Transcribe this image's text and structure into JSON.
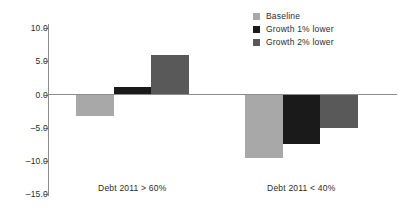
{
  "chart_data": {
    "type": "bar",
    "title": "",
    "subtitle": "",
    "xlabel": "",
    "ylabel": "",
    "categories": [
      "Debt 2011 > 60%",
      "Debt 2011 < 40%"
    ],
    "series": [
      {
        "name": "Baseline",
        "color": "#a8a8a8",
        "values": [
          -3.2,
          -9.6
        ]
      },
      {
        "name": "Growth 1% lower",
        "color": "#1a1a1a",
        "values": [
          1.1,
          -7.5
        ]
      },
      {
        "name": "Growth 2% lower",
        "color": "#595959",
        "values": [
          6.0,
          -5.0
        ]
      }
    ],
    "ylim": [
      -15.0,
      10.0
    ],
    "yticks": [
      10.0,
      5.0,
      0.0,
      -5.0,
      -10.0,
      -15.0
    ],
    "ytick_labels": [
      "10.0",
      "5.0",
      "0.0",
      "–5.0",
      "–10.0",
      "–15.0"
    ],
    "grid": false,
    "legend_position": "top-right",
    "zero_line": true
  },
  "axis": {
    "line_color": "#8d8d8d",
    "text_color": "#2b2b2b"
  },
  "legend": {
    "entries": [
      {
        "label": "Baseline",
        "color": "#a8a8a8"
      },
      {
        "label": "Growth 1% lower",
        "color": "#1a1a1a"
      },
      {
        "label": "Growth 2% lower",
        "color": "#595959"
      }
    ]
  }
}
